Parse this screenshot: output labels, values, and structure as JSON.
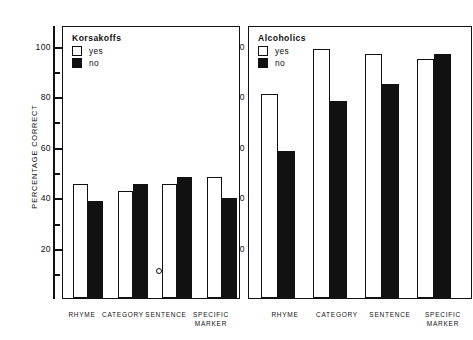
{
  "chart_data": {
    "type": "bar",
    "title": "",
    "xlabel": "",
    "ylabel": "PERCENTAGE CORRECT",
    "ylim": [
      0,
      105
    ],
    "ytick_labels": [
      "100",
      "80",
      "60",
      "40",
      "20"
    ],
    "ytick_values": [
      100,
      80,
      60,
      40,
      20
    ],
    "minor_ticks": [
      90,
      70,
      50,
      30,
      10
    ],
    "grid": false,
    "categories": [
      "RHYME",
      "CATEGORY",
      "SENTENCE",
      "SPECIFIC MARKER"
    ],
    "category_lines": [
      [
        "RHYME"
      ],
      [
        "CATEGORY"
      ],
      [
        "SENTENCE"
      ],
      [
        "SPECIFIC",
        "MARKER"
      ]
    ],
    "legend_position": "upper-left-inside",
    "panels": [
      {
        "name": "Korsakoffs",
        "legend_title": "Korsakoffs",
        "series": [
          {
            "name": "yes",
            "style": "open",
            "values": [
              46,
              43,
              46,
              48.5
            ]
          },
          {
            "name": "no",
            "style": "filled",
            "values": [
              39,
              46,
              48.5,
              40
            ]
          }
        ]
      },
      {
        "name": "Alcoholics",
        "legend_title": "Alcoholics",
        "series": [
          {
            "name": "yes",
            "style": "open",
            "values": [
              82,
              100,
              98,
              96
            ]
          },
          {
            "name": "no",
            "style": "filled",
            "values": [
              59,
              79,
              86,
              98
            ]
          }
        ]
      }
    ]
  },
  "axis": {
    "ylabel": "PERCENTAGE CORRECT",
    "y_100": "100",
    "y_80": "80",
    "y_60": "60",
    "y_40": "40",
    "y_20": "20"
  },
  "left_panel": {
    "legend_title": "Korsakoffs",
    "legend_yes": "yes",
    "legend_no": "no",
    "x_labels": {
      "rhyme": "RHYME",
      "category": "CATEGORY",
      "sentence": "SENTENCE",
      "specific_1": "SPECIFIC",
      "specific_2": "MARKER"
    }
  },
  "right_panel": {
    "legend_title": "Alcoholics",
    "legend_yes": "yes",
    "legend_no": "no",
    "y_100": "100",
    "y_80": "80",
    "y_60": "60",
    "y_40": "40",
    "y_20": "20",
    "x_labels": {
      "rhyme": "RHYME",
      "category": "CATEGORY",
      "sentence": "SENTENCE",
      "specific_1": "SPECIFIC",
      "specific_2": "MARKER"
    }
  },
  "colors": {
    "ink": "#111111",
    "paper": "#ffffff"
  }
}
